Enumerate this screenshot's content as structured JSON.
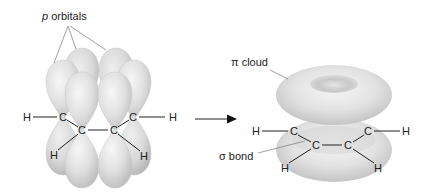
{
  "labels": {
    "p_orbitals_italic": "p",
    "p_orbitals_rest": " orbitals",
    "pi_cloud": "π cloud",
    "sigma_bond": "σ bond"
  },
  "left_molecule": {
    "atoms": [
      {
        "symbol": "H",
        "x": 27,
        "y": 117
      },
      {
        "symbol": "C",
        "x": 63,
        "y": 117
      },
      {
        "symbol": "C",
        "x": 82,
        "y": 130
      },
      {
        "symbol": "C",
        "x": 114,
        "y": 130
      },
      {
        "symbol": "C",
        "x": 133,
        "y": 117
      },
      {
        "symbol": "H",
        "x": 173,
        "y": 117
      },
      {
        "symbol": "H",
        "x": 54,
        "y": 155
      },
      {
        "symbol": "H",
        "x": 144,
        "y": 156
      }
    ]
  },
  "right_molecule": {
    "atoms": [
      {
        "symbol": "H",
        "x": 256,
        "y": 131
      },
      {
        "symbol": "C",
        "x": 294,
        "y": 131
      },
      {
        "symbol": "C",
        "x": 316,
        "y": 145
      },
      {
        "symbol": "C",
        "x": 348,
        "y": 145
      },
      {
        "symbol": "C",
        "x": 368,
        "y": 131
      },
      {
        "symbol": "H",
        "x": 406,
        "y": 131
      },
      {
        "symbol": "H",
        "x": 285,
        "y": 168
      },
      {
        "symbol": "H",
        "x": 378,
        "y": 168
      }
    ]
  },
  "colors": {
    "orbital_light": "#f2f2f2",
    "orbital_mid": "#d4d4d4",
    "orbital_dark": "#b8b8b8",
    "line": "#222222",
    "leader": "#777777"
  }
}
